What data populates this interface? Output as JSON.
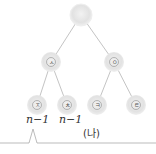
{
  "tree": {
    "root": {
      "label": ""
    },
    "level2": [
      {
        "label": "ㅅ"
      },
      {
        "label": "ㅇ"
      }
    ],
    "level3": [
      {
        "label": "ㅈ"
      },
      {
        "label": "ㅊ"
      },
      {
        "label": "ㅋ"
      },
      {
        "label": "ㅌ"
      }
    ]
  },
  "annotations": {
    "left_label": "n−1",
    "right_label": "n−1",
    "caption": "(나)"
  },
  "colors": {
    "node_fill": "#e4e4e4",
    "node_edge": "#f4f4f4",
    "line": "#bdbdbd"
  }
}
